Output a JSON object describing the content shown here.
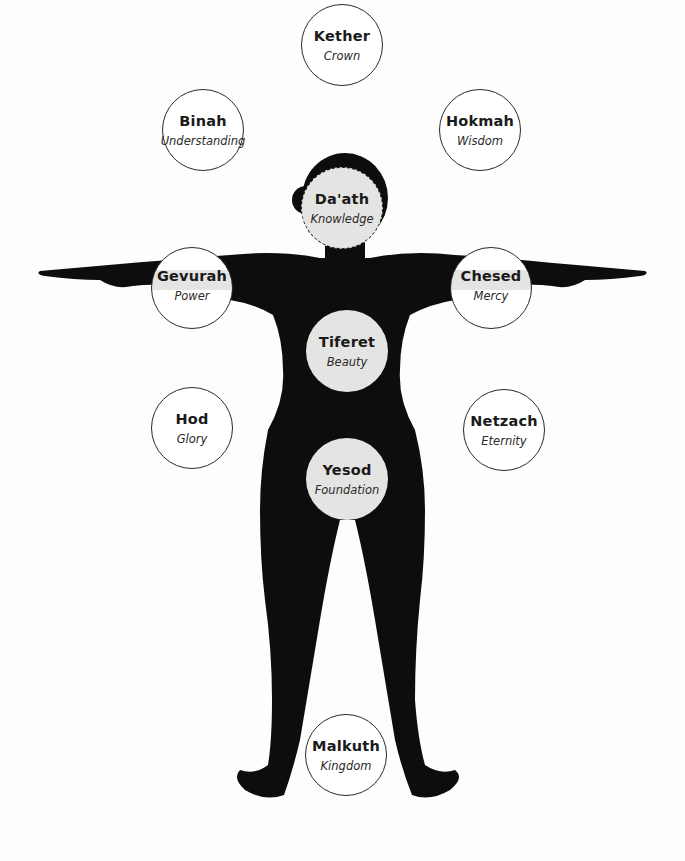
{
  "diagram": {
    "type": "sephirot-on-human-figure",
    "colors": {
      "background": "#fdfdfb",
      "silhouette": "#0d0d0d",
      "circle_fill_on_body": "#e4e4e2",
      "circle_outline": "#2a2a2a",
      "text": "#1a1a1a"
    },
    "sephirot": [
      {
        "id": "kether",
        "name": "Kether",
        "meaning": "Crown",
        "style": "outlined",
        "cx": 342,
        "cy": 45,
        "r": 41
      },
      {
        "id": "binah",
        "name": "Binah",
        "meaning": "Understanding",
        "style": "outlined",
        "cx": 203,
        "cy": 130,
        "r": 41
      },
      {
        "id": "hokmah",
        "name": "Hokmah",
        "meaning": "Wisdom",
        "style": "outlined",
        "cx": 480,
        "cy": 130,
        "r": 41
      },
      {
        "id": "daath",
        "name": "Da'ath",
        "meaning": "Knowledge",
        "style": "dashed",
        "cx": 342,
        "cy": 208,
        "r": 41
      },
      {
        "id": "gevurah",
        "name": "Gevurah",
        "meaning": "Power",
        "style": "banded",
        "cx": 192,
        "cy": 288,
        "r": 41
      },
      {
        "id": "chesed",
        "name": "Chesed",
        "meaning": "Mercy",
        "style": "banded",
        "cx": 491,
        "cy": 288,
        "r": 41
      },
      {
        "id": "tiferet",
        "name": "Tiferet",
        "meaning": "Beauty",
        "style": "filled",
        "cx": 347,
        "cy": 351,
        "r": 41
      },
      {
        "id": "hod",
        "name": "Hod",
        "meaning": "Glory",
        "style": "outlined",
        "cx": 192,
        "cy": 428,
        "r": 41
      },
      {
        "id": "netzach",
        "name": "Netzach",
        "meaning": "Eternity",
        "style": "outlined",
        "cx": 504,
        "cy": 430,
        "r": 41
      },
      {
        "id": "yesod",
        "name": "Yesod",
        "meaning": "Foundation",
        "style": "filled",
        "cx": 347,
        "cy": 479,
        "r": 41
      },
      {
        "id": "malkuth",
        "name": "Malkuth",
        "meaning": "Kingdom",
        "style": "outlined",
        "cx": 346,
        "cy": 755,
        "r": 41
      }
    ]
  }
}
